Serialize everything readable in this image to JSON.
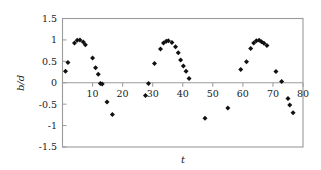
{
  "chart_data": {
    "type": "scatter",
    "title": "",
    "xlabel": "t",
    "ylabel": "b/d",
    "xlim": [
      0,
      80
    ],
    "ylim": [
      -1.5,
      1.5
    ],
    "grid": false,
    "legend": null,
    "xticks": [
      10,
      20,
      30,
      40,
      50,
      60,
      70,
      80
    ],
    "yticks": [
      1.5,
      1,
      0.5,
      0,
      -0.5,
      -1,
      -1.5
    ],
    "xtick_labels": [
      "10",
      "20",
      "30",
      "40",
      "50",
      "60",
      "70",
      "80"
    ],
    "ytick_labels": [
      "1.5",
      "1",
      "0.5",
      "0",
      "-0.5",
      "-1",
      "-1.5"
    ],
    "marker": "diamond",
    "marker_color": "#111111",
    "series": [
      {
        "name": "b/d",
        "points": [
          [
            1.0,
            0.27
          ],
          [
            1.8,
            0.47
          ],
          [
            4.0,
            0.93
          ],
          [
            4.9,
            0.99
          ],
          [
            5.8,
            1.0
          ],
          [
            6.9,
            0.95
          ],
          [
            7.6,
            0.89
          ],
          [
            10.0,
            0.58
          ],
          [
            11.0,
            0.35
          ],
          [
            11.9,
            0.2
          ],
          [
            12.6,
            -0.02
          ],
          [
            13.2,
            -0.03
          ],
          [
            14.8,
            -0.45
          ],
          [
            16.6,
            -0.74
          ],
          [
            27.6,
            -0.3
          ],
          [
            28.6,
            -0.02
          ],
          [
            30.6,
            0.45
          ],
          [
            32.6,
            0.79
          ],
          [
            33.6,
            0.93
          ],
          [
            34.5,
            0.97
          ],
          [
            35.2,
            0.98
          ],
          [
            36.4,
            0.94
          ],
          [
            37.6,
            0.84
          ],
          [
            38.5,
            0.7
          ],
          [
            39.3,
            0.53
          ],
          [
            40.2,
            0.39
          ],
          [
            41.1,
            0.27
          ],
          [
            42.1,
            0.1
          ],
          [
            47.4,
            -0.83
          ],
          [
            55.0,
            -0.59
          ],
          [
            59.3,
            0.31
          ],
          [
            61.2,
            0.49
          ],
          [
            62.6,
            0.8
          ],
          [
            63.6,
            0.93
          ],
          [
            64.5,
            0.98
          ],
          [
            65.4,
            0.99
          ],
          [
            66.2,
            0.96
          ],
          [
            67.0,
            0.92
          ],
          [
            68.0,
            0.87
          ],
          [
            71.0,
            0.26
          ],
          [
            72.9,
            0.03
          ],
          [
            75.0,
            -0.37
          ],
          [
            75.6,
            -0.52
          ],
          [
            76.7,
            -0.7
          ]
        ]
      }
    ]
  },
  "axes": {
    "x_title": "t",
    "y_title": "b/d"
  }
}
